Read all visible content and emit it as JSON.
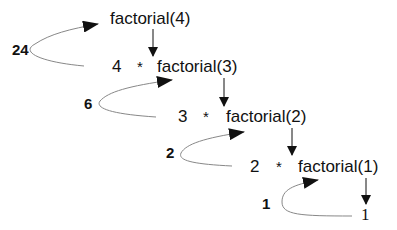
{
  "diagram": {
    "type": "recursion-trace",
    "calls": [
      {
        "label": "factorial(4)"
      },
      {
        "label": "factorial(3)",
        "multiplier": "4",
        "operator": "*"
      },
      {
        "label": "factorial(2)",
        "multiplier": "3",
        "operator": "*"
      },
      {
        "label": "factorial(1)",
        "multiplier": "2",
        "operator": "*"
      }
    ],
    "base_case": "1",
    "returns": [
      {
        "value": "24"
      },
      {
        "value": "6"
      },
      {
        "value": "2"
      },
      {
        "value": "1"
      }
    ],
    "colors": {
      "text": "#111111",
      "arrow": "#111111",
      "return_curve": "#888888",
      "background": "#ffffff"
    }
  }
}
